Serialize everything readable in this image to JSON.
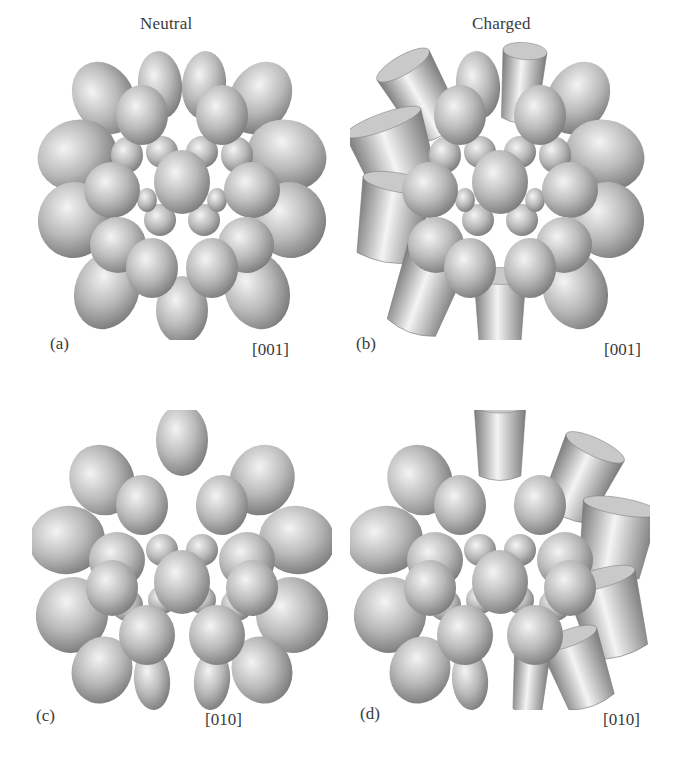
{
  "figure": {
    "columns": [
      {
        "title": "Neutral"
      },
      {
        "title": "Charged"
      }
    ],
    "panels": [
      {
        "id": "a",
        "letter": "(a)",
        "direction": "[001]",
        "state": "Neutral",
        "view": "[001]"
      },
      {
        "id": "b",
        "letter": "(b)",
        "direction": "[001]",
        "state": "Charged",
        "view": "[001]"
      },
      {
        "id": "c",
        "letter": "(c)",
        "direction": "[010]",
        "state": "Neutral",
        "view": "[010]"
      },
      {
        "id": "d",
        "letter": "(d)",
        "direction": "[010]",
        "state": "Charged",
        "view": "[010]"
      }
    ],
    "colors": {
      "blob_highlight": "#f4f4f4",
      "blob_mid": "#b9b9b9",
      "blob_shadow": "#7a7a7a",
      "label_text": "#3a3a3a"
    }
  }
}
